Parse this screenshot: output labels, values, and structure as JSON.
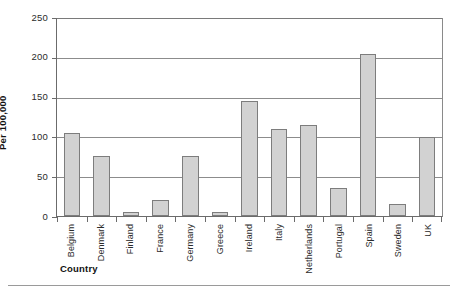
{
  "chart_data": {
    "type": "bar",
    "title": "",
    "xlabel": "Country",
    "ylabel": "Per 100,000",
    "ylim": [
      0,
      250
    ],
    "yticks": [
      0,
      50,
      100,
      150,
      200,
      250
    ],
    "ytick_labels": [
      "0",
      "50",
      "100",
      "150",
      "200",
      "250"
    ],
    "grid": true,
    "legend": "none",
    "categories": [
      "Belgium",
      "Denmark",
      "Finland",
      "France",
      "Germany",
      "Greece",
      "Ireland",
      "Italy",
      "Netherlands",
      "Portugal",
      "Spain",
      "Sweden",
      "UK"
    ],
    "values": [
      105,
      76,
      5,
      20,
      76,
      5,
      145,
      110,
      115,
      35,
      205,
      15,
      100
    ],
    "bar_fill_color": "#d2d2d2",
    "bar_edge_color": "#7d7d7d",
    "grid_color": "#8c8c8c",
    "axis_color": "#6b6b6b"
  }
}
